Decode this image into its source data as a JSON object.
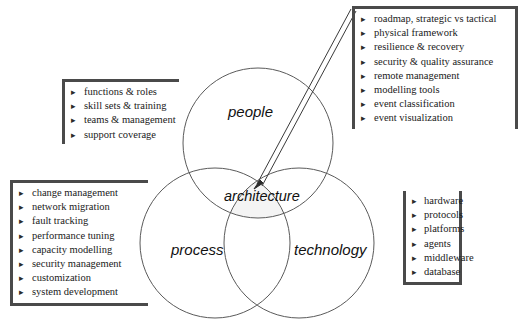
{
  "diagram": {
    "title_text": "",
    "circles": [
      {
        "id": "people",
        "label": "people"
      },
      {
        "id": "process",
        "label": "process"
      },
      {
        "id": "technology",
        "label": "technology"
      }
    ],
    "center_label": "architecture",
    "colors": {
      "circle_stroke": "#5a5a5a",
      "center_fill": "#f2f2f2",
      "box_border": "#4a4a4a",
      "text": "#1a1a1a",
      "arrow": "#3a3a3a",
      "background": "#ffffff"
    }
  },
  "notes": {
    "people": {
      "bullet_glyph": "▸",
      "items": [
        "functions & roles",
        "skill sets & training",
        "teams & management",
        "support coverage"
      ]
    },
    "architecture": {
      "bullet_glyph": "▸",
      "items": [
        "roadmap, strategic vs tactical",
        "physical framework",
        "resilience & recovery",
        "security & quality assurance",
        "remote management",
        "modelling tools",
        "event classification",
        "event visualization"
      ]
    },
    "process": {
      "bullet_glyph": "▸",
      "items": [
        "change management",
        "network migration",
        "fault tracking",
        "performance tuning",
        "capacity modelling",
        "security management",
        "customization",
        "system development"
      ]
    },
    "technology": {
      "bullet_glyph": "▸",
      "items": [
        "hardware",
        "protocols",
        "platforms",
        "agents",
        "middleware",
        "database"
      ]
    }
  }
}
